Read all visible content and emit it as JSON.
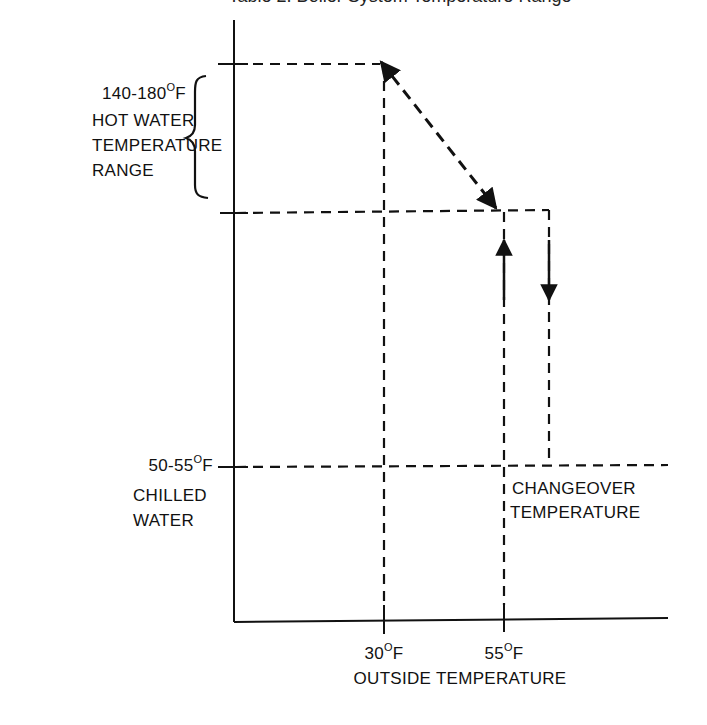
{
  "title_partial": "Table 2. Boiler System Temperature Range",
  "y_labels": {
    "hot_water": {
      "range": "140-180",
      "unit": "F",
      "line2": "HOT WATER",
      "line3": "TEMPERATURE",
      "line4": "RANGE"
    },
    "chilled_water": {
      "range": "50-55",
      "unit": "F",
      "line2": "CHILLED",
      "line3": "WATER"
    }
  },
  "x_labels": {
    "tick1": {
      "value": "30",
      "unit": "F"
    },
    "tick2": {
      "value": "55",
      "unit": "F"
    },
    "axis_title": "OUTSIDE TEMPERATURE"
  },
  "annotation": {
    "line1": "CHANGEOVER",
    "line2": "TEMPERATURE"
  },
  "colors": {
    "ink": "#111111",
    "background": "#ffffff"
  }
}
